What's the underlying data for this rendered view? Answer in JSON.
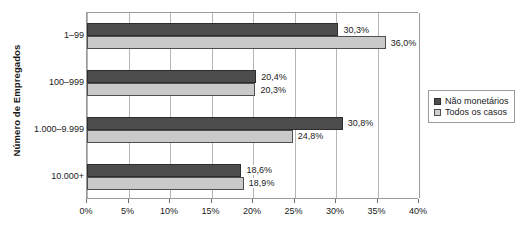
{
  "chart_data": {
    "type": "bar",
    "orientation": "horizontal",
    "title": "",
    "xlabel": "",
    "ylabel": "Número de Empregados",
    "categories": [
      "1–99",
      "100–999",
      "1.000–9.999",
      "10.000+"
    ],
    "series": [
      {
        "name": "Não monetários",
        "color": "#4d4d4d",
        "values": [
          30.3,
          20.4,
          30.8,
          18.6
        ],
        "labels": [
          "30,3%",
          "20,4%",
          "30,8%",
          "18,6%"
        ]
      },
      {
        "name": "Todos os casos",
        "color": "#c9c9c9",
        "values": [
          36.0,
          20.3,
          24.8,
          18.9
        ],
        "labels": [
          "36,0%",
          "20,3%",
          "24,8%",
          "18,9%"
        ]
      }
    ],
    "xlim": [
      0,
      40
    ],
    "xticks": [
      0,
      5,
      10,
      15,
      20,
      25,
      30,
      35,
      40
    ],
    "xtick_labels": [
      "0%",
      "5%",
      "10%",
      "15%",
      "20%",
      "25%",
      "30%",
      "35%",
      "40%"
    ],
    "grid": "vertical",
    "legend_position": "right"
  },
  "legend": {
    "items": [
      {
        "label": "Não monetários",
        "swatch": "dark-square-icon"
      },
      {
        "label": "Todos os casos",
        "swatch": "light-square-icon"
      }
    ]
  }
}
